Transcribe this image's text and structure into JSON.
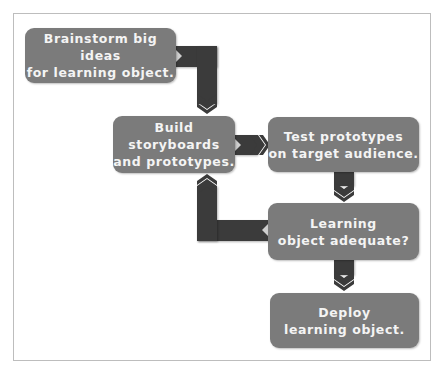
{
  "diagram": {
    "type": "flowchart",
    "colors": {
      "box": "#7b7b7b",
      "connector": "#3b3b3b",
      "text": "#f4f4f4",
      "frame": "#bdbdbd"
    },
    "nodes": [
      {
        "id": "brainstorm",
        "label": "Brainstorm big ideas\nfor learning object."
      },
      {
        "id": "build",
        "label": "Build storyboards\nand prototypes."
      },
      {
        "id": "test",
        "label": "Test prototypes\non target audience."
      },
      {
        "id": "adequate",
        "label": "Learning\nobject adequate?"
      },
      {
        "id": "deploy",
        "label": "Deploy\nlearning object."
      }
    ],
    "edges": [
      {
        "from": "brainstorm",
        "to": "build"
      },
      {
        "from": "build",
        "to": "test"
      },
      {
        "from": "test",
        "to": "adequate"
      },
      {
        "from": "adequate",
        "to": "build"
      },
      {
        "from": "adequate",
        "to": "deploy"
      }
    ]
  }
}
